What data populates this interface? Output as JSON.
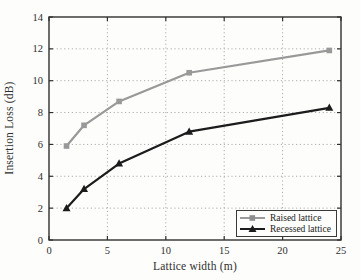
{
  "chart_data": {
    "type": "line",
    "title": "",
    "xlabel": "Lattice width (m)",
    "ylabel": "Insertion Loss (dB)",
    "xlim": [
      0,
      25
    ],
    "ylim": [
      0,
      14
    ],
    "xticks": [
      0,
      5,
      10,
      15,
      20,
      25
    ],
    "yticks": [
      0,
      2,
      4,
      6,
      8,
      10,
      12,
      14
    ],
    "grid": true,
    "grid_style": "dotted",
    "legend_position": "lower right",
    "x": [
      1.5,
      3,
      6,
      12,
      24
    ],
    "series": [
      {
        "name": "Raised lattice",
        "values": [
          5.9,
          7.2,
          8.7,
          10.5,
          11.9
        ],
        "color": "#999999",
        "marker": "square"
      },
      {
        "name": "Recessed lattice",
        "values": [
          2.0,
          3.2,
          4.8,
          6.8,
          8.3
        ],
        "color": "#1c1c1c",
        "marker": "triangle"
      }
    ],
    "colors": {
      "grid": "#adadad",
      "frame": "#2f2f2f",
      "text": "#2f2f2f",
      "background": "#fdfdfb"
    }
  }
}
